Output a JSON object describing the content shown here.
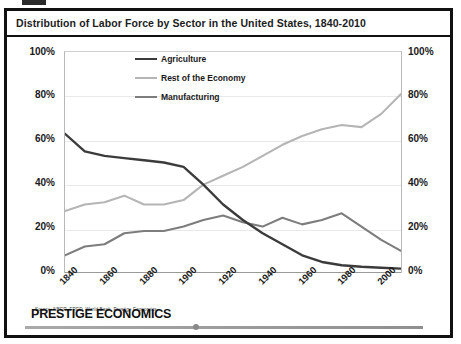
{
  "header": {
    "title": "Distribution of Labor Force by Sector in the United States, 1840-2010"
  },
  "source_note": "Source: NBER, FRED, World Bank, Prestige Economics",
  "footer": {
    "brand": "PRESTIGE ECONOMICS"
  },
  "axes": {
    "left_labels": [
      "100%",
      "80%",
      "60%",
      "40%",
      "20%",
      "0%"
    ],
    "right_labels": [
      "100%",
      "80%",
      "60%",
      "40%",
      "20%",
      "0%"
    ]
  },
  "colors": {
    "agriculture": "#3b3b3b",
    "rest_of_economy": "#b5b5b5",
    "manufacturing": "#7d7d7d",
    "frame": "#111111",
    "grid": "#e9e9e9"
  },
  "chart_data": {
    "type": "line",
    "title": "Distribution of Labor Force by Sector in the United States, 1840-2010",
    "xlabel": "",
    "ylabel": "",
    "xlim": [
      1840,
      2010
    ],
    "ylim": [
      0,
      100
    ],
    "grid": true,
    "legend_position": "top-center",
    "tick_labels_x": [
      "1840",
      "1860",
      "1880",
      "1900",
      "1920",
      "1940",
      "1960",
      "1980",
      "2000"
    ],
    "tick_labels_y": [
      "0%",
      "20%",
      "40%",
      "60%",
      "80%",
      "100%"
    ],
    "x": [
      1840,
      1850,
      1860,
      1870,
      1880,
      1890,
      1900,
      1910,
      1920,
      1930,
      1940,
      1950,
      1960,
      1970,
      1980,
      1990,
      2000,
      2010
    ],
    "series": [
      {
        "name": "Agriculture",
        "color": "#3b3b3b",
        "values": [
          63,
          55,
          53,
          52,
          51,
          50,
          48,
          40,
          31,
          24,
          18,
          13,
          8,
          5,
          3.5,
          2.8,
          2.4,
          2
        ]
      },
      {
        "name": "Rest of the Economy",
        "color": "#b5b5b5",
        "values": [
          28,
          31,
          32,
          35,
          31,
          31,
          33,
          40,
          44,
          48,
          53,
          58,
          62,
          65,
          67,
          66,
          72,
          81
        ]
      },
      {
        "name": "Manufacturing",
        "color": "#7d7d7d",
        "values": [
          8,
          12,
          13,
          18,
          19,
          19,
          21,
          24,
          26,
          23,
          21,
          25,
          22,
          24,
          27,
          21,
          15,
          10
        ]
      }
    ]
  }
}
